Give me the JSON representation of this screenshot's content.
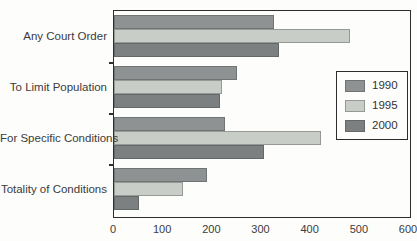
{
  "chart_data": {
    "type": "bar",
    "orientation": "horizontal",
    "title": "",
    "xlabel": "",
    "ylabel": "",
    "grid": false,
    "legend_position": "right-inside",
    "categories": [
      "Any Court Order",
      "To Limit Population",
      "For Specific Conditions",
      "Totality of Conditions"
    ],
    "series": [
      {
        "name": "1990",
        "color": "#8e9292",
        "values": [
          325,
          250,
          225,
          190
        ]
      },
      {
        "name": "1995",
        "color": "#c9cdc7",
        "values": [
          480,
          220,
          420,
          140
        ]
      },
      {
        "name": "2000",
        "color": "#7c8080",
        "values": [
          335,
          215,
          305,
          50
        ]
      }
    ],
    "xlim": [
      0,
      600
    ],
    "x_ticks": [
      0,
      100,
      200,
      300,
      400,
      500,
      600
    ]
  },
  "colors": {
    "axis": "#2e2e2e",
    "text": "#3b3b3b",
    "background": "#fdfdfb"
  }
}
